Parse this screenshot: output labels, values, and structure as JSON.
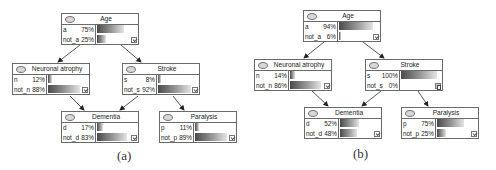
{
  "panels": [
    {
      "caption": "(a)",
      "nodes": {
        "age": {
          "title": "Age",
          "states": [
            {
              "label": "a",
              "pct": "75%",
              "value": 75
            },
            {
              "label": "not_a",
              "pct": "25%",
              "value": 25
            }
          ],
          "marker": "checkbox-icon"
        },
        "neuronal": {
          "title": "Neuronal atrophy",
          "states": [
            {
              "label": "n",
              "pct": "12%",
              "value": 12
            },
            {
              "label": "not_n",
              "pct": "88%",
              "value": 88
            }
          ],
          "marker": "checkbox-icon"
        },
        "stroke": {
          "title": "Stroke",
          "states": [
            {
              "label": "s",
              "pct": "8%",
              "value": 8
            },
            {
              "label": "not_s",
              "pct": "92%",
              "value": 92
            }
          ],
          "marker": "checkbox-icon"
        },
        "dementia": {
          "title": "Dementia",
          "states": [
            {
              "label": "d",
              "pct": "17%",
              "value": 17
            },
            {
              "label": "not_d",
              "pct": "83%",
              "value": 83
            }
          ],
          "marker": "checkbox-icon"
        },
        "paralysis": {
          "title": "Paralysis",
          "states": [
            {
              "label": "p",
              "pct": "11%",
              "value": 11
            },
            {
              "label": "not_p",
              "pct": "89%",
              "value": 89
            }
          ],
          "marker": "checkbox-icon"
        }
      }
    },
    {
      "caption": "(b)",
      "nodes": {
        "age": {
          "title": "Age",
          "states": [
            {
              "label": "a",
              "pct": "94%",
              "value": 94
            },
            {
              "label": "not_a",
              "pct": "6%",
              "value": 6
            }
          ],
          "marker": "checkbox-icon"
        },
        "neuronal": {
          "title": "Neuronal atrophy",
          "states": [
            {
              "label": "n",
              "pct": "14%",
              "value": 14
            },
            {
              "label": "not_n",
              "pct": "86%",
              "value": 86
            }
          ],
          "marker": "checkbox-icon"
        },
        "stroke": {
          "title": "Stroke",
          "states": [
            {
              "label": "s",
              "pct": "100%",
              "value": 100
            },
            {
              "label": "not_s",
              "pct": "0%",
              "value": 0
            }
          ],
          "marker": "evidence-icon"
        },
        "dementia": {
          "title": "Dementia",
          "states": [
            {
              "label": "d",
              "pct": "52%",
              "value": 52
            },
            {
              "label": "not_d",
              "pct": "48%",
              "value": 48
            }
          ],
          "marker": "checkbox-icon"
        },
        "paralysis": {
          "title": "Paralysis",
          "states": [
            {
              "label": "p",
              "pct": "75%",
              "value": 75
            },
            {
              "label": "not_p",
              "pct": "25%",
              "value": 25
            }
          ],
          "marker": "checkbox-icon"
        }
      }
    }
  ],
  "edges": [
    [
      "age",
      "neuronal"
    ],
    [
      "age",
      "stroke"
    ],
    [
      "neuronal",
      "dementia"
    ],
    [
      "stroke",
      "dementia"
    ],
    [
      "stroke",
      "paralysis"
    ]
  ],
  "colors": {
    "border": "#6a6a6a",
    "bar_dark": "#4a4a4a",
    "bar_light": "#e4e4e4",
    "arrow": "#222222"
  }
}
